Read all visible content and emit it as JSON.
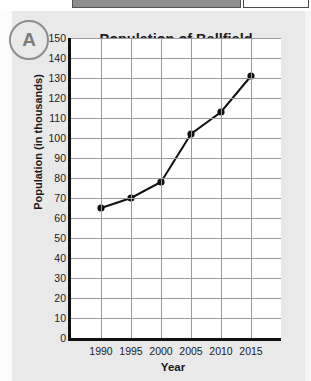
{
  "top_strip": {
    "gray_bar_label": "",
    "white_box_label": ""
  },
  "problem": {
    "letter": "A"
  },
  "chart_data": {
    "type": "line",
    "title": "Population of Bellfield",
    "xlabel": "Year",
    "ylabel": "Population (in thousands)",
    "categories": [
      "1990",
      "1995",
      "2000",
      "2005",
      "2010",
      "2015"
    ],
    "x": [
      1990,
      1995,
      2000,
      2005,
      2010,
      2015
    ],
    "values": [
      65,
      70,
      78,
      102,
      113,
      131
    ],
    "series": [
      {
        "name": "Population of Bellfield",
        "values": [
          65,
          70,
          78,
          102,
          113,
          131
        ]
      }
    ],
    "ylim": [
      0,
      150
    ],
    "ytick_step": 10,
    "yticks": [
      0,
      10,
      20,
      30,
      40,
      50,
      60,
      70,
      80,
      90,
      100,
      110,
      120,
      130,
      140,
      150
    ],
    "ytick_labels": [
      "0",
      "10",
      "20",
      "30",
      "40",
      "50",
      "60",
      "70",
      "80",
      "90",
      "100",
      "110",
      "120",
      "130",
      "140",
      "150"
    ],
    "xtick_labels": [
      "1990",
      "1995",
      "2000",
      "2005",
      "2010",
      "2015"
    ],
    "grid": true,
    "legend": false,
    "legend_position": "none",
    "marker": "filled-circle",
    "line_color": "#111111",
    "marker_color": "#111111",
    "grid_color": "#9a9a9a",
    "axis_color": "#111111",
    "plot_background": "#ffffff"
  }
}
